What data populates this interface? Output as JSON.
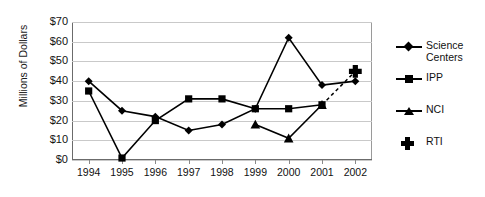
{
  "axes": {
    "ylabel": "Millions of Dollars",
    "yticks": [
      "$70",
      "$60",
      "$50",
      "$40",
      "$30",
      "$20",
      "$10",
      "$0"
    ],
    "xticks": [
      "1994",
      "1995",
      "1996",
      "1997",
      "1998",
      "1999",
      "2000",
      "2001",
      "2002"
    ]
  },
  "legend": {
    "items": [
      {
        "label": "Science\nCenters",
        "marker": "diamond-marker-icon",
        "line": true
      },
      {
        "label": "IPP",
        "marker": "square-marker-icon",
        "line": true
      },
      {
        "label": "NCI",
        "marker": "triangle-marker-icon",
        "line": true
      },
      {
        "label": "RTI",
        "marker": "plus-marker-icon",
        "line": false
      }
    ]
  },
  "colors": {
    "series": "#000000",
    "gridline": "#c9c9c9",
    "axis": "#6b6b6b",
    "background": "#ffffff"
  },
  "chart_data": {
    "type": "line",
    "title": "",
    "xlabel": "",
    "ylabel": "Millions of Dollars",
    "ylim": [
      0,
      70
    ],
    "ytick_step": 10,
    "grid": true,
    "legend_position": "right",
    "categories": [
      "1994",
      "1995",
      "1996",
      "1997",
      "1998",
      "1999",
      "2000",
      "2001",
      "2002"
    ],
    "series": [
      {
        "name": "Science Centers",
        "marker": "diamond",
        "linestyle": "solid",
        "x": [
          "1994",
          "1995",
          "1996",
          "1997",
          "1998",
          "1999",
          "2000",
          "2001",
          "2002"
        ],
        "values": [
          40,
          25,
          22,
          15,
          18,
          26,
          62,
          38,
          40
        ]
      },
      {
        "name": "IPP",
        "marker": "square",
        "linestyle": "solid",
        "x": [
          "1994",
          "1995",
          "1996",
          "1997",
          "1998",
          "1999",
          "2000",
          "2001"
        ],
        "values": [
          35,
          1,
          20,
          31,
          31,
          26,
          26,
          28
        ]
      },
      {
        "name": "NCI",
        "marker": "triangle",
        "linestyle": "solid",
        "x": [
          "1999",
          "2000",
          "2001"
        ],
        "values": [
          18,
          11,
          28
        ]
      },
      {
        "name": "RTI",
        "marker": "plus",
        "linestyle": "dashed",
        "x": [
          "2002"
        ],
        "values": [
          45
        ],
        "note": "single point connected to NCI 2001 by a dashed line"
      }
    ]
  }
}
